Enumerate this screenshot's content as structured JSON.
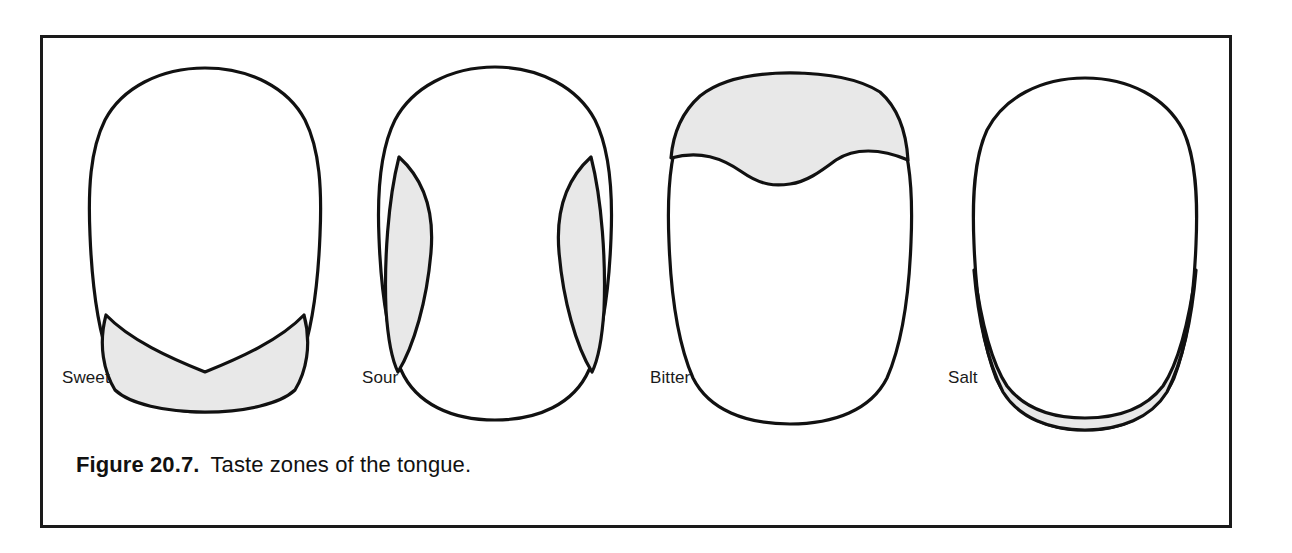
{
  "figure": {
    "caption_label": "Figure 20.7.",
    "caption_text": "Taste zones of the tongue.",
    "frame_color": "#1a1a1a",
    "background_color": "#ffffff"
  },
  "style": {
    "outline_color": "#111111",
    "zone_fill_color": "#e8e8e8",
    "tongue_fill_color": "#ffffff",
    "label_color": "#1a1a1a"
  },
  "diagrams": [
    {
      "id": "sweet",
      "label": "Sweet",
      "zone_description": "shaded region across the tip and front of the tongue with a V-shaped notch dipping down at the midline",
      "zone_location": "tip",
      "label_x": 62,
      "label_y": 383
    },
    {
      "id": "sour",
      "label": "Sour",
      "zone_description": "two shaded crescent (lens-shaped) bands along the left and right lateral edges of the tongue",
      "zone_location": "lateral-edges",
      "label_x": 362,
      "label_y": 383
    },
    {
      "id": "bitter",
      "label": "Bitter",
      "zone_description": "shaded band across the back of the tongue bounded by a wavy S-curve that dips at the midline",
      "zone_location": "back",
      "label_x": 650,
      "label_y": 383
    },
    {
      "id": "salt",
      "label": "Salt",
      "zone_description": "narrow shaded U-shaped crescent band following the lower margin of the tongue",
      "zone_location": "front-margin",
      "label_x": 948,
      "label_y": 383
    }
  ]
}
